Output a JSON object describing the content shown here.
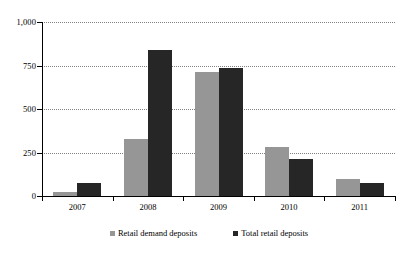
{
  "chart_data": {
    "type": "bar",
    "title": "",
    "xlabel": "",
    "ylabel": "",
    "categories": [
      "2007",
      "2008",
      "2009",
      "2010",
      "2011"
    ],
    "series": [
      {
        "name": "Retail demand deposits",
        "color": "#969696",
        "values": [
          25,
          330,
          710,
          280,
          100
        ]
      },
      {
        "name": "Total retail deposits",
        "color": "#262626",
        "values": [
          75,
          840,
          735,
          215,
          72
        ]
      }
    ],
    "ylim": [
      0,
      1000
    ],
    "yticks": [
      0,
      250,
      500,
      750,
      1000
    ],
    "ytick_labels": [
      "0",
      "250",
      "500",
      "750",
      "1,000"
    ],
    "grid": true,
    "legend_position": "bottom"
  }
}
